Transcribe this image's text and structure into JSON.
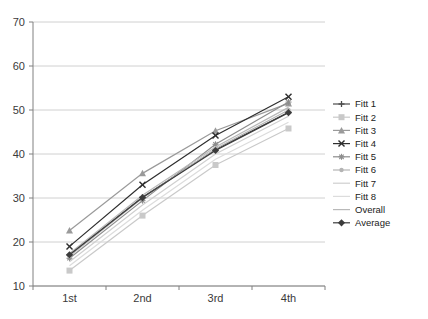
{
  "chart_data": {
    "type": "line",
    "title": "",
    "subtitle": "",
    "xlabel": "",
    "ylabel": "",
    "categories": [
      "1st",
      "2nd",
      "3rd",
      "4th"
    ],
    "ylim": [
      10,
      70
    ],
    "yticks": [
      10,
      20,
      30,
      40,
      50,
      60,
      70
    ],
    "ytick_labels": [
      "10",
      "20",
      "30",
      "40",
      "50",
      "60",
      "70"
    ],
    "grid": true,
    "grid_axis": "y",
    "legend_position": "right",
    "series": [
      {
        "name": "Fitt 1",
        "values": [
          17.0,
          30.2,
          41.0,
          49.5
        ],
        "color": "#4a4a4a",
        "marker": "plus"
      },
      {
        "name": "Fitt 2",
        "values": [
          13.5,
          26.0,
          37.5,
          45.8
        ],
        "color": "#c9c9c9",
        "marker": "square"
      },
      {
        "name": "Fitt 3",
        "values": [
          22.6,
          35.6,
          45.3,
          51.5
        ],
        "color": "#9a9a9a",
        "marker": "triangle"
      },
      {
        "name": "Fitt 4",
        "values": [
          19.0,
          33.0,
          44.2,
          53.0
        ],
        "color": "#2e2e2e",
        "marker": "cross"
      },
      {
        "name": "Fitt 5",
        "values": [
          16.3,
          29.4,
          42.2,
          51.8
        ],
        "color": "#8d8d8d",
        "marker": "asterisk"
      },
      {
        "name": "Fitt 6",
        "values": [
          16.8,
          30.0,
          41.2,
          50.0
        ],
        "color": "#b4b4b4",
        "marker": "dot"
      },
      {
        "name": "Fitt 7",
        "values": [
          15.5,
          28.4,
          40.0,
          48.6
        ],
        "color": "#cfcfcf",
        "marker": "none"
      },
      {
        "name": "Fitt 8",
        "values": [
          14.6,
          27.2,
          38.8,
          47.2
        ],
        "color": "#dcdcdc",
        "marker": "none"
      },
      {
        "name": "Overall",
        "values": [
          17.4,
          30.6,
          41.6,
          50.6
        ],
        "color": "#b9b9b9",
        "marker": "none"
      },
      {
        "name": "Average",
        "values": [
          17.1,
          30.1,
          40.8,
          49.4
        ],
        "color": "#3c3c3c",
        "marker": "diamond"
      }
    ]
  },
  "axes": {
    "y_tick_labels": [
      "70",
      "60",
      "50",
      "40",
      "30",
      "20",
      "10"
    ],
    "x_tick_labels": [
      "1st",
      "2nd",
      "3rd",
      "4th"
    ]
  },
  "legend": {
    "items": [
      {
        "label": "Fitt 1"
      },
      {
        "label": "Fitt 2"
      },
      {
        "label": "Fitt 3"
      },
      {
        "label": "Fitt 4"
      },
      {
        "label": "Fitt 5"
      },
      {
        "label": "Fitt 6"
      },
      {
        "label": "Fitt 7"
      },
      {
        "label": "Fitt 8"
      },
      {
        "label": "Overall"
      },
      {
        "label": "Average"
      }
    ]
  },
  "colors": {
    "axis": "#808080",
    "grid": "#d0d0d0",
    "background": "#ffffff",
    "text": "#3a3a3a"
  }
}
